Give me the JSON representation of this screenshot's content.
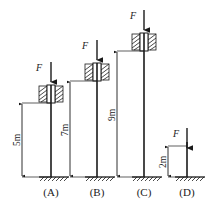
{
  "figure": {
    "stroke_color": "#1a1a1a",
    "background_color": "#ffffff",
    "force_symbol": "F",
    "cases": [
      {
        "key": "A",
        "label": "(A)",
        "length_label": "5m",
        "length_value": 5,
        "unit": "m",
        "force_label": "F",
        "top_condition": "guided-collar",
        "base_condition": "fixed-hatched-ground"
      },
      {
        "key": "B",
        "label": "(B)",
        "length_label": "7m",
        "length_value": 7,
        "unit": "m",
        "force_label": "F",
        "top_condition": "guided-collar",
        "base_condition": "fixed-hatched-ground"
      },
      {
        "key": "C",
        "label": "(C)",
        "length_label": "9m",
        "length_value": 9,
        "unit": "m",
        "force_label": "F",
        "top_condition": "guided-collar",
        "base_condition": "fixed-hatched-ground"
      },
      {
        "key": "D",
        "label": "(D)",
        "length_label": "2m",
        "length_value": 2,
        "unit": "m",
        "force_label": "F",
        "top_condition": "free",
        "base_condition": "fixed-hatched-ground"
      }
    ]
  }
}
